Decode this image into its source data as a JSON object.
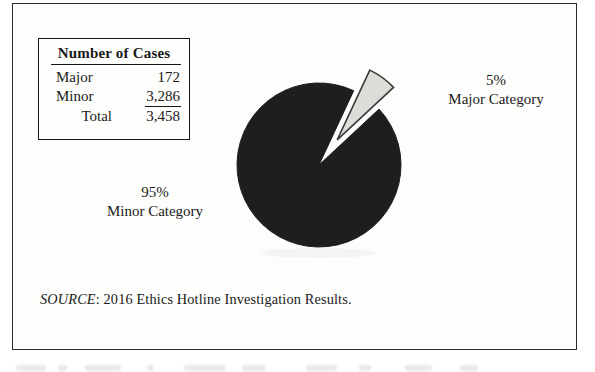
{
  "stats_box": {
    "title": "Number of Cases",
    "rows": [
      {
        "label": "Major",
        "value": "172"
      },
      {
        "label": "Minor",
        "value": "3,286"
      },
      {
        "label": "Total",
        "value": "3,458"
      }
    ]
  },
  "chart_data": {
    "type": "pie",
    "title": "",
    "slices": [
      {
        "label": "Major Category",
        "pct": 5,
        "cases": 172,
        "color": "#dcdcd9",
        "exploded": true
      },
      {
        "label": "Minor Category",
        "pct": 95,
        "cases": 3286,
        "color": "#1e1e1e",
        "exploded": false
      }
    ],
    "annotations": [
      {
        "line1": "5%",
        "line2": "Major Category",
        "position": "right-of-pie"
      },
      {
        "line1": "95%",
        "line2": "Minor Category",
        "position": "left-below-pie"
      }
    ],
    "legend": "none"
  },
  "source_note": {
    "prefix": "SOURCE",
    "rest": ": 2016 Ethics Hotline Investigation Results."
  },
  "colors": {
    "frame_border": "#2b2b2b",
    "pie_minor_fill": "#1e1e1e",
    "pie_major_fill": "#dcdcd9",
    "pie_major_stroke": "#3c3c3c",
    "text": "#1a1a1a",
    "background": "#fdfdfb"
  }
}
